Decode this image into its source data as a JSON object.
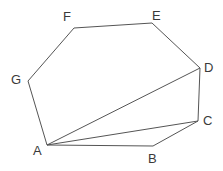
{
  "figure": {
    "background_color": "#ffffff",
    "stroke_color": "#555555",
    "label_color": "#3a3a3a",
    "stroke_width": 1,
    "width": 223,
    "height": 171
  },
  "vertices": [
    {
      "id": "A",
      "label": "A",
      "x": 47,
      "y": 145,
      "label_x": 33,
      "label_y": 144
    },
    {
      "id": "B",
      "label": "B",
      "x": 153,
      "y": 146,
      "label_x": 148,
      "label_y": 152
    },
    {
      "id": "C",
      "label": "C",
      "x": 198,
      "y": 121,
      "label_x": 203,
      "label_y": 114
    },
    {
      "id": "D",
      "label": "D",
      "x": 200,
      "y": 68,
      "label_x": 204,
      "label_y": 61
    },
    {
      "id": "E",
      "label": "E",
      "x": 152,
      "y": 23,
      "label_x": 152,
      "label_y": 9
    },
    {
      "id": "F",
      "label": "F",
      "x": 74,
      "y": 28,
      "label_x": 63,
      "label_y": 10
    },
    {
      "id": "G",
      "label": "G",
      "x": 28,
      "y": 81,
      "label_x": 11,
      "label_y": 73
    }
  ],
  "outline": {
    "name": "polygon-outline",
    "points": "47,145 153,146 198,121 200,68 152,23 74,28 28,81",
    "sequence": [
      "A",
      "B",
      "C",
      "D",
      "E",
      "F",
      "G"
    ]
  },
  "diagonals": [
    {
      "name": "diagonal-a-c",
      "from": "A",
      "to": "C",
      "x1": 47,
      "y1": 145,
      "x2": 198,
      "y2": 121
    },
    {
      "name": "diagonal-a-d",
      "from": "A",
      "to": "D",
      "x1": 47,
      "y1": 145,
      "x2": 200,
      "y2": 68
    }
  ]
}
